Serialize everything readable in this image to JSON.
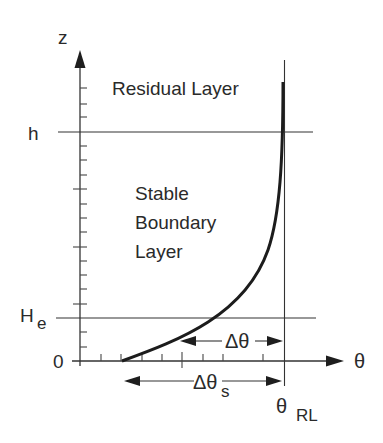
{
  "diagram": {
    "type": "stable-boundary-layer-profile",
    "axes": {
      "y_label": "z",
      "x_label": "θ",
      "y_ticks": {
        "h": "h",
        "He_main": "H",
        "He_sub": "e",
        "zero": "0"
      }
    },
    "regions": {
      "residual_layer": "Residual Layer",
      "stable_line1": "Stable",
      "stable_line2": "Boundary",
      "stable_line3": "Layer"
    },
    "annotations": {
      "delta_theta": "Δθ",
      "delta_theta_s_main": "Δθ",
      "delta_theta_s_sub": "s",
      "theta_rl_main": "θ",
      "theta_rl_sub": "RL"
    },
    "colors": {
      "ink": "#2a2a2a",
      "curve": "#1c1c1c",
      "background": "#ffffff"
    }
  }
}
